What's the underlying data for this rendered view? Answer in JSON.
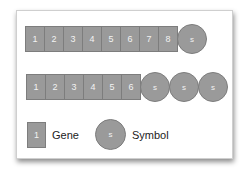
{
  "rows": [
    {
      "genes": [
        "1",
        "2",
        "3",
        "4",
        "5",
        "6",
        "7",
        "8"
      ],
      "symbols": [
        "s"
      ]
    },
    {
      "genes": [
        "1",
        "2",
        "3",
        "4",
        "5",
        "6"
      ],
      "symbols": [
        "s",
        "s",
        "s"
      ]
    }
  ],
  "legend": {
    "gene_glyph": "1",
    "gene_label": "Gene",
    "symbol_glyph": "s",
    "symbol_label": "Symbol"
  },
  "colors": {
    "fill": "#9a9a9a",
    "border": "#7d7d7d"
  }
}
